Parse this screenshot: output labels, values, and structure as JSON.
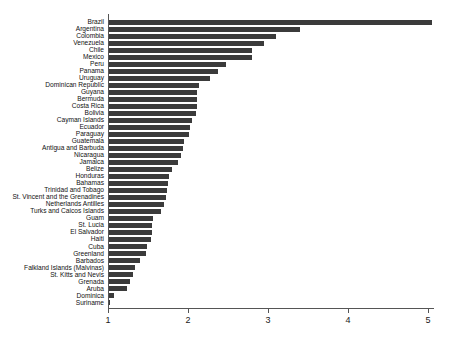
{
  "chart": {
    "title": "",
    "subtitle": "",
    "xlabel": "",
    "ylabel": ""
  },
  "axis": {
    "x_ticks": [
      "1",
      "2",
      "3",
      "4",
      "5"
    ],
    "x_min": 1,
    "x_max": 5.25,
    "grid": "off"
  },
  "style": {
    "bar_color": "#3b3b3b",
    "axis_color": "#555555",
    "background": "#ffffff",
    "label_color": "#111111"
  },
  "chart_data": {
    "type": "bar",
    "orientation": "horizontal",
    "title": "",
    "subtitle": "",
    "xlabel": "",
    "ylabel": "",
    "xlim": [
      1,
      5.25
    ],
    "grid": false,
    "legend": "none",
    "xticks": [
      1,
      2,
      3,
      4,
      5
    ],
    "categories": [
      "Brazil",
      "Argentina",
      "Colombia",
      "Venezuela",
      "Chile",
      "Mexico",
      "Peru",
      "Panama",
      "Uruguay",
      "Dominican Republic",
      "Guyana",
      "Bermuda",
      "Costa Rica",
      "Bolivia",
      "Cayman Islands",
      "Ecuador",
      "Paraguay",
      "Guatemala",
      "Antigua and Barbuda",
      "Nicaragua",
      "Jamaica",
      "Belize",
      "Honduras",
      "Bahamas",
      "Trinidad and Tobago",
      "St. Vincent and the Grenadines",
      "Netherlands Antilles",
      "Turks and Caicos Islands",
      "Guam",
      "St. Lucia",
      "El Salvador",
      "Haiti",
      "Cuba",
      "Greenland",
      "Barbados",
      "Falkland Islands (Malvinas)",
      "St. Kitts and Nevis",
      "Grenada",
      "Aruba",
      "Dominica",
      "Suriname"
    ],
    "values": [
      5.05,
      3.4,
      3.1,
      2.95,
      2.8,
      2.8,
      2.48,
      2.38,
      2.28,
      2.14,
      2.11,
      2.11,
      2.11,
      2.1,
      2.05,
      2.03,
      2.01,
      1.95,
      1.94,
      1.91,
      1.88,
      1.8,
      1.76,
      1.75,
      1.74,
      1.73,
      1.7,
      1.66,
      1.56,
      1.55,
      1.55,
      1.54,
      1.49,
      1.47,
      1.4,
      1.34,
      1.31,
      1.27,
      1.24,
      1.08,
      1.03
    ]
  }
}
